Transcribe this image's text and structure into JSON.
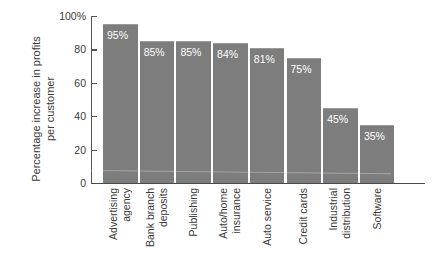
{
  "chart_data": {
    "type": "bar",
    "title": "",
    "xlabel": "",
    "ylabel": "Percentage increase in profits per customer",
    "ylabel_lines": [
      "Percentage increase in profits",
      "per customer"
    ],
    "ylim": [
      0,
      100
    ],
    "grid": false,
    "legend": null,
    "orientation": "vertical",
    "bar_color": "#7d7d7d",
    "value_label_color": "#ffffff",
    "yticks": [
      {
        "value": 100,
        "label": "100%"
      },
      {
        "value": 80,
        "label": "80"
      },
      {
        "value": 60,
        "label": "60"
      },
      {
        "value": 40,
        "label": "40"
      },
      {
        "value": 20,
        "label": "20"
      },
      {
        "value": 0,
        "label": "0"
      }
    ],
    "categories": [
      "Advertising agency",
      "Bank branch deposits",
      "Publishing",
      "Auto/home insurance",
      "Auto service",
      "Credit cards",
      "Industrial distribution",
      "Software"
    ],
    "category_label_lines": [
      [
        "Advertising",
        "agency"
      ],
      [
        "Bank branch",
        "deposits"
      ],
      [
        "Publishing"
      ],
      [
        "Auto/home",
        "insurance"
      ],
      [
        "Auto service"
      ],
      [
        "Credit cards"
      ],
      [
        "Industrial",
        "distribution"
      ],
      [
        "Software"
      ]
    ],
    "values": [
      95,
      85,
      85,
      84,
      81,
      75,
      45,
      35
    ],
    "value_labels": [
      "95%",
      "85%",
      "85%",
      "84%",
      "81%",
      "75%",
      "45%",
      "35%"
    ]
  }
}
